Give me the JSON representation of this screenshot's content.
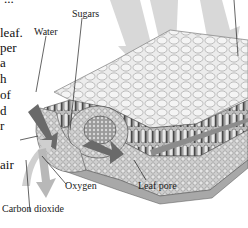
{
  "figure": {
    "title_fragment": "...",
    "labels": {
      "sugars": "Sugars",
      "water": "Water",
      "oxygen": "Oxygen",
      "carbon_dioxide": "Carbon dioxide",
      "leaf_pore": "Leaf pore"
    },
    "body_text_fragments": [
      "leaf.",
      "per",
      "a",
      "h",
      "of",
      "d",
      "r",
      "air"
    ],
    "colors": {
      "arrow_gray": "#c8c8c8",
      "arrow_dark": "#6e6e6e",
      "cell_fill": "#e6e6e6",
      "cell_stroke": "#9a9a9a",
      "tissue_dark": "#5a5a5a"
    }
  }
}
